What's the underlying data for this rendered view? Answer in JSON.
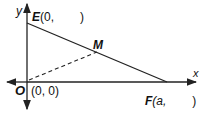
{
  "diagram": {
    "axes": {
      "x_label": "x",
      "y_label": "y"
    },
    "points": {
      "O": {
        "name": "O",
        "coords": "(0, 0)"
      },
      "E": {
        "name": "E",
        "coords_prefix": "(0,",
        "coords_suffix": ")"
      },
      "F": {
        "name": "F",
        "coords_prefix": "(a,",
        "coords_suffix": ")"
      },
      "M": {
        "name": "M"
      }
    },
    "segments": [
      {
        "from": "E",
        "to": "F",
        "style": "solid"
      },
      {
        "from": "O",
        "to": "M",
        "style": "dashed"
      }
    ]
  }
}
